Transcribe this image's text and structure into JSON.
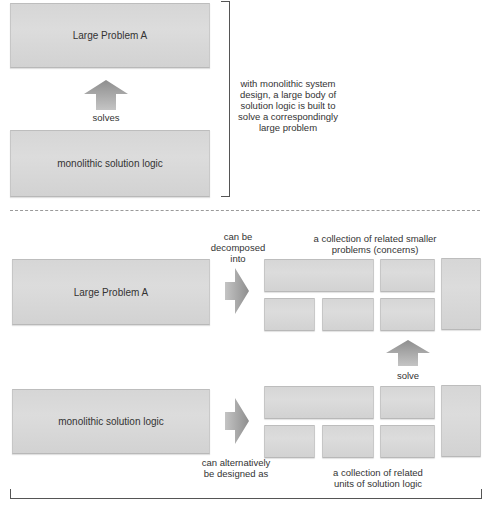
{
  "top_section": {
    "problem_box_label": "Large Problem A",
    "solution_box_label": "monolithic solution logic",
    "arrow_label": "solves",
    "bracket_note": "with monolithic system design, a large body of solution logic is built to solve a correspondingly large problem"
  },
  "bottom_section": {
    "problem_box_label": "Large Problem A",
    "solution_box_label": "monolithic solution logic",
    "decompose_label": "can be decomposed into",
    "alternative_label": "can alternatively be designed as",
    "problems_collection_label": "a collection of related smaller problems (concerns)",
    "solution_collection_label": "a collection of related units of solution logic",
    "solve_label": "solve"
  },
  "colors": {
    "box_fill": "#d8d8d8",
    "arrow_fill": "#a0a0a0",
    "text": "#333333",
    "divider": "#9a9a9a"
  }
}
